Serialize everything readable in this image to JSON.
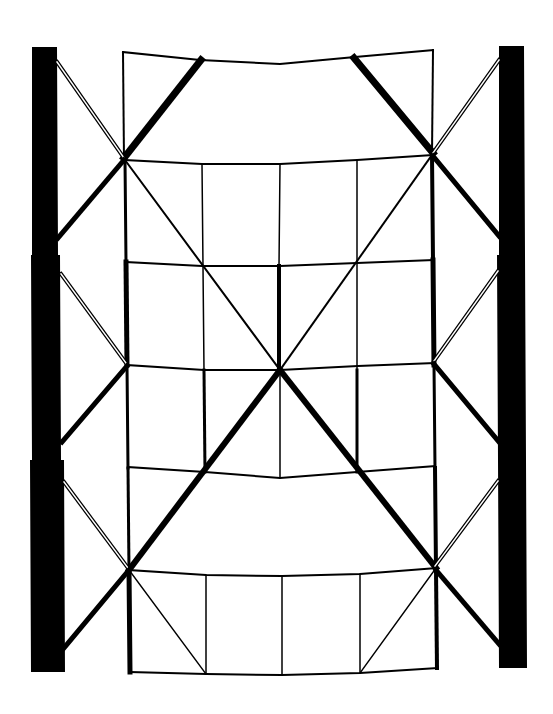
{
  "diagram": {
    "type": "structural-frame-deformation",
    "colors": {
      "background": "#ffffff",
      "stroke": "#000000"
    },
    "labels": []
  }
}
